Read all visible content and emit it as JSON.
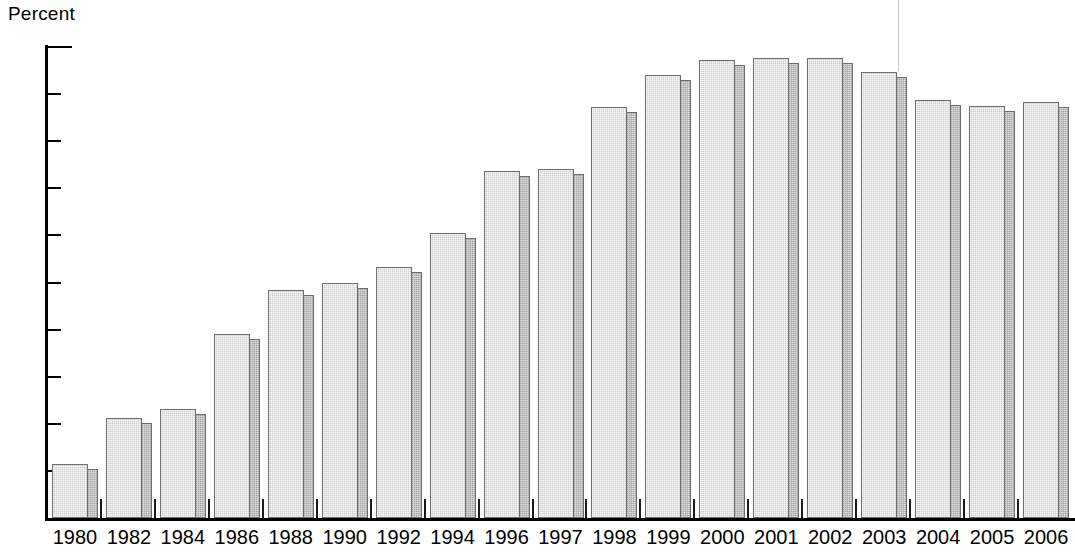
{
  "chart_data": {
    "type": "bar",
    "title": "",
    "subtitle": "",
    "ylabel": "Percent",
    "xlabel": "",
    "ylim": [
      0,
      50
    ],
    "ytick_step": 5,
    "yticks": [
      0,
      5,
      10,
      15,
      20,
      25,
      30,
      35,
      40,
      45,
      50
    ],
    "grid": false,
    "legend": null,
    "categories": [
      "1980",
      "1982",
      "1984",
      "1986",
      "1988",
      "1990",
      "1992",
      "1994",
      "1996",
      "1997",
      "1998",
      "1999",
      "2000",
      "2001",
      "2002",
      "2003",
      "2004",
      "2005",
      "2006"
    ],
    "values": [
      5.7,
      10.6,
      11.6,
      19.5,
      24.2,
      24.9,
      26.7,
      30.3,
      36.8,
      37.1,
      43.6,
      47.0,
      48.6,
      48.8,
      48.8,
      47.4,
      44.4,
      43.7,
      44.2
    ],
    "series": [
      {
        "name": "Percent",
        "values": [
          5.7,
          10.6,
          11.6,
          19.5,
          24.2,
          24.9,
          26.7,
          30.3,
          36.8,
          37.1,
          43.6,
          47.0,
          48.6,
          48.8,
          48.8,
          47.4,
          44.4,
          43.7,
          44.2
        ]
      }
    ],
    "bar_style": {
      "front_color": "#cfcfcf",
      "side_color": "#a3a3a3",
      "outline_color": "#6d6d6d",
      "three_d": true
    },
    "axis_color": "#000000"
  }
}
